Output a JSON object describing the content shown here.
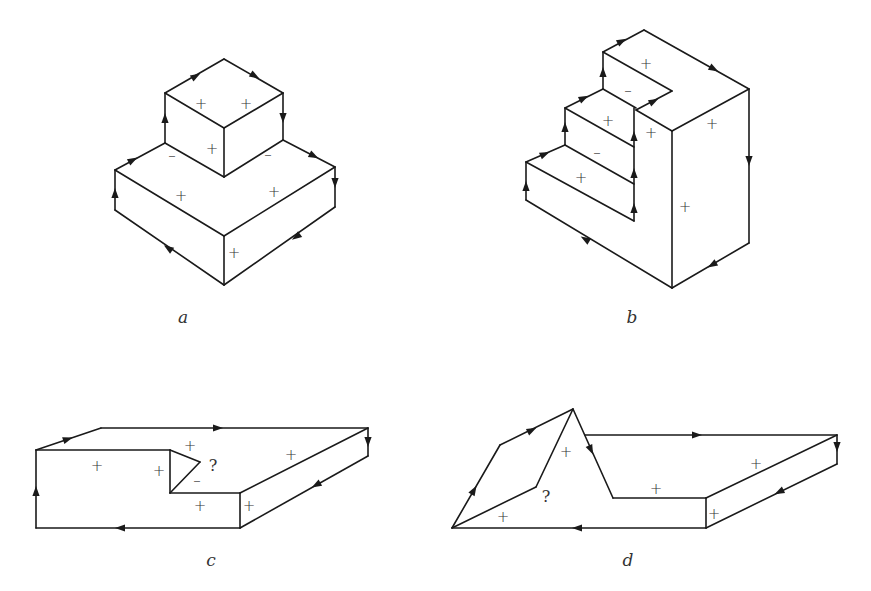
{
  "figures": [
    {
      "id": "a",
      "caption": "a",
      "caption_pos": [
        183,
        323
      ],
      "edges": [
        [
          [
            165,
            93
          ],
          [
            224,
            59
          ]
        ],
        [
          [
            224,
            59
          ],
          [
            283,
            93
          ]
        ],
        [
          [
            165,
            93
          ],
          [
            224,
            128
          ]
        ],
        [
          [
            224,
            128
          ],
          [
            283,
            93
          ]
        ],
        [
          [
            165,
            93
          ],
          [
            165,
            143
          ]
        ],
        [
          [
            283,
            93
          ],
          [
            283,
            140
          ]
        ],
        [
          [
            224,
            128
          ],
          [
            224,
            177
          ]
        ],
        [
          [
            165,
            143
          ],
          [
            224,
            177
          ]
        ],
        [
          [
            224,
            177
          ],
          [
            283,
            140
          ]
        ],
        [
          [
            115,
            170
          ],
          [
            165,
            143
          ]
        ],
        [
          [
            283,
            140
          ],
          [
            335,
            167
          ]
        ],
        [
          [
            115,
            170
          ],
          [
            224,
            236
          ]
        ],
        [
          [
            224,
            236
          ],
          [
            335,
            167
          ]
        ],
        [
          [
            115,
            170
          ],
          [
            115,
            210
          ]
        ],
        [
          [
            335,
            167
          ],
          [
            335,
            207
          ]
        ],
        [
          [
            224,
            236
          ],
          [
            224,
            285
          ]
        ],
        [
          [
            115,
            210
          ],
          [
            224,
            285
          ]
        ],
        [
          [
            224,
            285
          ],
          [
            335,
            207
          ]
        ]
      ],
      "arrows": [
        {
          "at": [
            196,
            76
          ],
          "dir": [
            59,
            -34
          ]
        },
        {
          "at": [
            255,
            76
          ],
          "dir": [
            59,
            34
          ]
        },
        {
          "at": [
            283,
            118
          ],
          "dir": [
            0,
            1
          ]
        },
        {
          "at": [
            165,
            118
          ],
          "dir": [
            0,
            -1
          ]
        },
        {
          "at": [
            133,
            160
          ],
          "dir": [
            50,
            -27
          ]
        },
        {
          "at": [
            314,
            156
          ],
          "dir": [
            52,
            27
          ]
        },
        {
          "at": [
            335,
            183
          ],
          "dir": [
            0,
            1
          ]
        },
        {
          "at": [
            115,
            193
          ],
          "dir": [
            0,
            -1
          ]
        },
        {
          "at": [
            168,
            248
          ],
          "dir": [
            -109,
            -75
          ]
        },
        {
          "at": [
            296,
            237
          ],
          "dir": [
            -111,
            78
          ]
        }
      ],
      "marks": [
        {
          "t": "+",
          "at": [
            201,
            104
          ]
        },
        {
          "t": "+",
          "at": [
            246,
            104
          ]
        },
        {
          "t": "+",
          "at": [
            212,
            149
          ]
        },
        {
          "t": "–",
          "at": [
            172,
            156
          ]
        },
        {
          "t": "–",
          "at": [
            268,
            155
          ]
        },
        {
          "t": "+",
          "at": [
            181,
            196
          ]
        },
        {
          "t": "+",
          "at": [
            274,
            192
          ]
        },
        {
          "t": "+",
          "at": [
            234,
            253
          ]
        }
      ]
    },
    {
      "id": "b",
      "caption": "b",
      "caption_pos": [
        632,
        323
      ],
      "edges": [
        [
          [
            603,
            52
          ],
          [
            644,
            30
          ]
        ],
        [
          [
            644,
            30
          ],
          [
            749,
            89
          ]
        ],
        [
          [
            603,
            52
          ],
          [
            672,
            91
          ]
        ],
        [
          [
            672,
            91
          ],
          [
            636,
            110
          ]
        ],
        [
          [
            603,
            52
          ],
          [
            603,
            89
          ]
        ],
        [
          [
            565,
            108
          ],
          [
            603,
            89
          ]
        ],
        [
          [
            603,
            89
          ],
          [
            636,
            108
          ]
        ],
        [
          [
            565,
            108
          ],
          [
            565,
            145
          ]
        ],
        [
          [
            565,
            108
          ],
          [
            634,
            147
          ]
        ],
        [
          [
            526,
            162
          ],
          [
            565,
            145
          ]
        ],
        [
          [
            565,
            145
          ],
          [
            634,
            184
          ]
        ],
        [
          [
            526,
            162
          ],
          [
            526,
            200
          ]
        ],
        [
          [
            526,
            162
          ],
          [
            634,
            221
          ]
        ],
        [
          [
            634,
            108
          ],
          [
            634,
            221
          ]
        ],
        [
          [
            636,
            110
          ],
          [
            672,
            131
          ]
        ],
        [
          [
            672,
            131
          ],
          [
            749,
            89
          ]
        ],
        [
          [
            749,
            89
          ],
          [
            749,
            243
          ]
        ],
        [
          [
            672,
            131
          ],
          [
            672,
            288
          ]
        ],
        [
          [
            526,
            200
          ],
          [
            672,
            288
          ]
        ],
        [
          [
            672,
            288
          ],
          [
            749,
            243
          ]
        ]
      ],
      "arrows": [
        {
          "at": [
            622,
            41
          ],
          "dir": [
            41,
            -22
          ]
        },
        {
          "at": [
            714,
            69
          ],
          "dir": [
            105,
            59
          ]
        },
        {
          "at": [
            603,
            72
          ],
          "dir": [
            0,
            -1
          ]
        },
        {
          "at": [
            584,
            98
          ],
          "dir": [
            38,
            -19
          ]
        },
        {
          "at": [
            654,
            101
          ],
          "dir": [
            36,
            -19
          ]
        },
        {
          "at": [
            565,
            127
          ],
          "dir": [
            0,
            -1
          ]
        },
        {
          "at": [
            545,
            154
          ],
          "dir": [
            39,
            -17
          ]
        },
        {
          "at": [
            634,
            136
          ],
          "dir": [
            0,
            -1
          ]
        },
        {
          "at": [
            634,
            173
          ],
          "dir": [
            0,
            -1
          ]
        },
        {
          "at": [
            634,
            208
          ],
          "dir": [
            0,
            -1
          ]
        },
        {
          "at": [
            526,
            186
          ],
          "dir": [
            0,
            -1
          ]
        },
        {
          "at": [
            749,
            161
          ],
          "dir": [
            0,
            1
          ]
        },
        {
          "at": [
            585,
            239
          ],
          "dir": [
            -146,
            -88
          ]
        },
        {
          "at": [
            712,
            265
          ],
          "dir": [
            -77,
            45
          ]
        }
      ],
      "marks": [
        {
          "t": "+",
          "at": [
            646,
            64
          ]
        },
        {
          "t": "–",
          "at": [
            628,
            91
          ]
        },
        {
          "t": "+",
          "at": [
            608,
            121
          ]
        },
        {
          "t": "+",
          "at": [
            651,
            133
          ]
        },
        {
          "t": "+",
          "at": [
            712,
            124
          ]
        },
        {
          "t": "–",
          "at": [
            597,
            153
          ]
        },
        {
          "t": "+",
          "at": [
            581,
            178
          ]
        },
        {
          "t": "+",
          "at": [
            685,
            207
          ]
        }
      ]
    },
    {
      "id": "c",
      "caption": "c",
      "caption_pos": [
        211,
        566
      ],
      "edges": [
        [
          [
            36,
            450
          ],
          [
            101,
            428
          ]
        ],
        [
          [
            101,
            428
          ],
          [
            368,
            428
          ]
        ],
        [
          [
            36,
            450
          ],
          [
            170,
            450
          ]
        ],
        [
          [
            170,
            450
          ],
          [
            200,
            462
          ]
        ],
        [
          [
            200,
            462
          ],
          [
            170,
            493
          ]
        ],
        [
          [
            170,
            450
          ],
          [
            170,
            493
          ]
        ],
        [
          [
            170,
            493
          ],
          [
            240,
            493
          ]
        ],
        [
          [
            240,
            493
          ],
          [
            368,
            428
          ]
        ],
        [
          [
            368,
            428
          ],
          [
            368,
            456
          ]
        ],
        [
          [
            240,
            493
          ],
          [
            240,
            528
          ]
        ],
        [
          [
            240,
            528
          ],
          [
            368,
            456
          ]
        ],
        [
          [
            36,
            450
          ],
          [
            36,
            528
          ]
        ],
        [
          [
            36,
            528
          ],
          [
            240,
            528
          ]
        ]
      ],
      "arrows": [
        {
          "at": [
            68,
            439
          ],
          "dir": [
            65,
            -22
          ]
        },
        {
          "at": [
            218,
            428
          ],
          "dir": [
            1,
            0
          ]
        },
        {
          "at": [
            368,
            442
          ],
          "dir": [
            0,
            1
          ]
        },
        {
          "at": [
            316,
            485
          ],
          "dir": [
            -128,
            72
          ]
        },
        {
          "at": [
            120,
            528
          ],
          "dir": [
            -1,
            0
          ]
        },
        {
          "at": [
            36,
            491
          ],
          "dir": [
            0,
            -1
          ]
        }
      ],
      "marks": [
        {
          "t": "+",
          "at": [
            97,
            466
          ]
        },
        {
          "t": "+",
          "at": [
            159,
            471
          ]
        },
        {
          "t": "+",
          "at": [
            190,
            446
          ]
        },
        {
          "t": "–",
          "at": [
            197,
            481
          ]
        },
        {
          "t": "+",
          "at": [
            200,
            506
          ]
        },
        {
          "t": "+",
          "at": [
            249,
            506
          ]
        },
        {
          "t": "+",
          "at": [
            291,
            455
          ]
        }
      ],
      "qmarks": [
        {
          "t": "?",
          "at": [
            213,
            466
          ]
        }
      ]
    },
    {
      "id": "d",
      "caption": "d",
      "caption_pos": [
        628,
        566
      ],
      "edges": [
        [
          [
            452,
            528
          ],
          [
            500,
            445
          ]
        ],
        [
          [
            500,
            445
          ],
          [
            573,
            409
          ]
        ],
        [
          [
            452,
            528
          ],
          [
            536,
            487
          ]
        ],
        [
          [
            536,
            487
          ],
          [
            573,
            409
          ]
        ],
        [
          [
            573,
            409
          ],
          [
            613,
            498
          ]
        ],
        [
          [
            585,
            435
          ],
          [
            837,
            435
          ]
        ],
        [
          [
            613,
            498
          ],
          [
            706,
            498
          ]
        ],
        [
          [
            706,
            498
          ],
          [
            837,
            435
          ]
        ],
        [
          [
            837,
            435
          ],
          [
            837,
            464
          ]
        ],
        [
          [
            706,
            498
          ],
          [
            706,
            528
          ]
        ],
        [
          [
            706,
            528
          ],
          [
            837,
            464
          ]
        ],
        [
          [
            452,
            528
          ],
          [
            706,
            528
          ]
        ]
      ],
      "arrows": [
        {
          "at": [
            474,
            490
          ],
          "dir": [
            48,
            -83
          ]
        },
        {
          "at": [
            532,
            430
          ],
          "dir": [
            73,
            -36
          ]
        },
        {
          "at": [
            591,
            450
          ],
          "dir": [
            40,
            89
          ]
        },
        {
          "at": [
            697,
            435
          ],
          "dir": [
            1,
            0
          ]
        },
        {
          "at": [
            837,
            447
          ],
          "dir": [
            0,
            1
          ]
        },
        {
          "at": [
            779,
            492
          ],
          "dir": [
            -131,
            64
          ]
        },
        {
          "at": [
            577,
            528
          ],
          "dir": [
            -1,
            0
          ]
        }
      ],
      "marks": [
        {
          "t": "+",
          "at": [
            566,
            452
          ]
        },
        {
          "t": "+",
          "at": [
            503,
            517
          ]
        },
        {
          "t": "+",
          "at": [
            656,
            489
          ]
        },
        {
          "t": "+",
          "at": [
            756,
            464
          ]
        },
        {
          "t": "+",
          "at": [
            714,
            514
          ]
        }
      ],
      "qmarks": [
        {
          "t": "?",
          "at": [
            546,
            497
          ]
        }
      ]
    }
  ]
}
